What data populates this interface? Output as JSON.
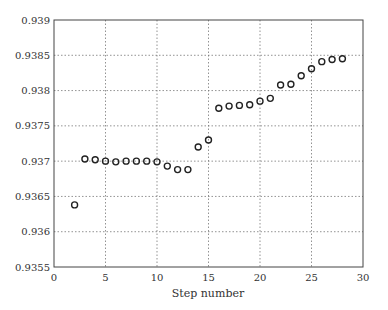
{
  "chart_data": {
    "type": "scatter",
    "title": "",
    "xlabel": "Step number",
    "ylabel": "",
    "xlim": [
      0,
      30
    ],
    "ylim": [
      0.9355,
      0.939
    ],
    "grid": true,
    "legend": null,
    "x_ticks": [
      0,
      5,
      10,
      15,
      20,
      25,
      30
    ],
    "y_ticks": [
      0.9355,
      0.936,
      0.9365,
      0.937,
      0.9375,
      0.938,
      0.9385,
      0.939
    ],
    "x_tick_labels": [
      "0",
      "5",
      "10",
      "15",
      "20",
      "25",
      "30"
    ],
    "y_tick_labels": [
      "0.9355",
      "0.936",
      "0.9365",
      "0.937",
      "0.9375",
      "0.938",
      "0.9385",
      "0.939"
    ],
    "marker": "circle-open",
    "x": [
      2,
      3,
      4,
      5,
      6,
      7,
      8,
      9,
      10,
      11,
      12,
      13,
      14,
      15,
      16,
      17,
      18,
      19,
      20,
      21,
      22,
      23,
      24,
      25,
      26,
      27,
      28
    ],
    "y": [
      0.93638,
      0.93703,
      0.93702,
      0.937,
      0.93699,
      0.937,
      0.937,
      0.937,
      0.93699,
      0.93693,
      0.93688,
      0.93688,
      0.9372,
      0.9373,
      0.93775,
      0.93778,
      0.93779,
      0.9378,
      0.93785,
      0.93789,
      0.93808,
      0.93809,
      0.93821,
      0.93831,
      0.93841,
      0.93844,
      0.93845
    ]
  }
}
